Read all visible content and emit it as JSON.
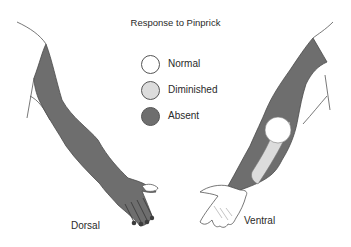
{
  "title": "Response to Pinprick",
  "legend": {
    "items": [
      {
        "label": "Normal",
        "color": "#ffffff"
      },
      {
        "label": "Diminished",
        "color": "#dcdcdc"
      },
      {
        "label": "Absent",
        "color": "#6e6e6e"
      }
    ]
  },
  "arms": {
    "left": {
      "label": "Dorsal"
    },
    "right": {
      "label": "Ventral"
    }
  },
  "colors": {
    "absent": "#6e6e6e",
    "diminished": "#dcdcdc",
    "normal": "#ffffff",
    "outline": "#444444"
  }
}
